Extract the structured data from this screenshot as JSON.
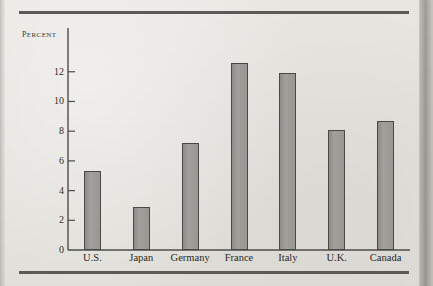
{
  "figure": {
    "background_color": "#e9e7e2",
    "rule_color": "#5c5a56",
    "bar_fill_color": "#9b9995",
    "bar_edge_color": "#4a4845",
    "axis_color": "#4e4c48",
    "text_color": "#2a2824"
  },
  "chart_data": {
    "type": "bar",
    "title": "",
    "subtitle": "",
    "xlabel": "",
    "ylabel": "Percent",
    "categories": [
      "U.S.",
      "Japan",
      "Germany",
      "France",
      "Italy",
      "U.K.",
      "Canada"
    ],
    "values": [
      5.3,
      2.9,
      7.2,
      12.6,
      11.9,
      8.1,
      8.7
    ],
    "ylim": [
      0,
      13.6
    ],
    "yticks": [
      0,
      2,
      4,
      6,
      8,
      10,
      12
    ],
    "ytick_labels": [
      "0",
      "2",
      "4",
      "6",
      "8",
      "10",
      "12"
    ],
    "grid": false,
    "legend": null,
    "legend_position": "none",
    "annotations": []
  },
  "axis": {
    "y_label": "Percent",
    "y_tick_labels": [
      "12",
      "10",
      "8",
      "6",
      "4",
      "2",
      "0"
    ],
    "x_tick_labels": [
      "U.S.",
      "Japan",
      "Germany",
      "France",
      "Italy",
      "U.K.",
      "Canada"
    ]
  }
}
